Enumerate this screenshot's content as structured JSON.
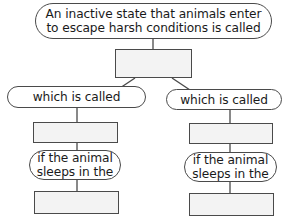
{
  "diagram": {
    "type": "concept-map",
    "colors": {
      "stroke": "#4a4a4a",
      "box_fill": "#f3f3f3",
      "oval_fill": "#ffffff",
      "text": "#1a1a1a"
    },
    "root": {
      "line1": "An inactive state that animals enter",
      "line2": "to escape harsh conditions is called"
    },
    "answer_box_center": "",
    "left": {
      "link_label": "which is called",
      "answer_box_1": "",
      "condition_line1": "if the animal",
      "condition_line2": "sleeps in the",
      "answer_box_2": ""
    },
    "right": {
      "link_label": "which is called",
      "answer_box_1": "",
      "condition_line1": "if the animal",
      "condition_line2": "sleeps in the",
      "answer_box_2": ""
    }
  }
}
